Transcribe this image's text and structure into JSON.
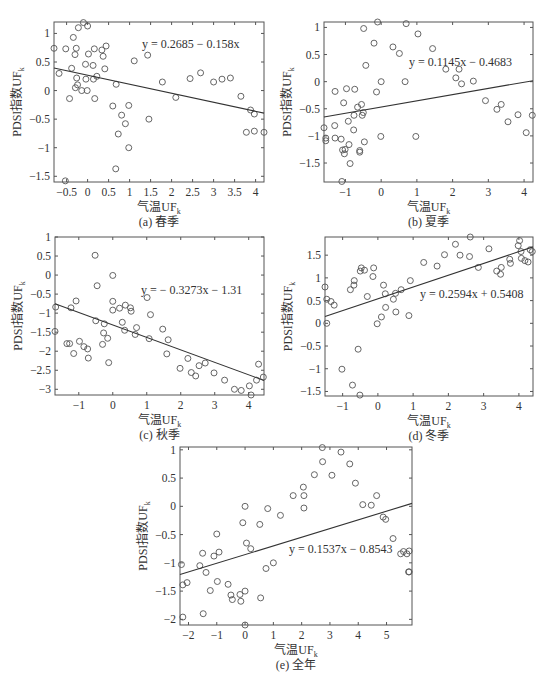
{
  "chart_data": [
    {
      "type": "scatter",
      "id": "a",
      "caption": "(a) 春季",
      "xlabel": "气温UF",
      "xlabel_sub": "k",
      "ylabel": "PDSI指数UF",
      "ylabel_sub": "k",
      "equation": "y = 0.2685 − 0.158x",
      "fit": {
        "slope": -0.158,
        "intercept": 0.2685
      },
      "xlim": [
        -0.8,
        4.2
      ],
      "ylim": [
        -1.6,
        1.2
      ],
      "xticks": [
        -0.5,
        0,
        0.5,
        1,
        1.5,
        2,
        2.5,
        3,
        3.5,
        4
      ],
      "yticks": [
        -1.5,
        -1,
        -0.5,
        0,
        0.5,
        1
      ],
      "box": {
        "left": 54,
        "top": 22,
        "right": 264,
        "bottom": 182
      },
      "eq_pos": {
        "x": 142,
        "y": 48
      },
      "points": [
        [
          -0.8,
          0.74
        ],
        [
          -0.68,
          0.3
        ],
        [
          -0.52,
          0.73
        ],
        [
          -0.43,
          -0.14
        ],
        [
          -0.38,
          0.39
        ],
        [
          -0.34,
          0.93
        ],
        [
          -0.3,
          0.63
        ],
        [
          -0.29,
          0.05
        ],
        [
          -0.27,
          0.74
        ],
        [
          -0.26,
          0.22
        ],
        [
          -0.24,
          0.1
        ],
        [
          -0.22,
          1.1
        ],
        [
          -0.14,
          0
        ],
        [
          -0.1,
          1.19
        ],
        [
          -0.05,
          0.46
        ],
        [
          -0.04,
          0.2
        ],
        [
          -0.01,
          0
        ],
        [
          0,
          1.13
        ],
        [
          0.02,
          0.64
        ],
        [
          0.13,
          0.44
        ],
        [
          0.14,
          0.2
        ],
        [
          0.16,
          0.73
        ],
        [
          0.17,
          -0.14
        ],
        [
          0.22,
          0.25
        ],
        [
          0.34,
          0.71
        ],
        [
          0.37,
          0.6
        ],
        [
          0.41,
          0.38
        ],
        [
          0.44,
          0.78
        ],
        [
          0.6,
          -0.27
        ],
        [
          0.67,
          -1.37
        ],
        [
          0.68,
          0.11
        ],
        [
          0.73,
          -0.76
        ],
        [
          0.81,
          -0.43
        ],
        [
          0.9,
          -0.58
        ],
        [
          0.98,
          -0.26
        ],
        [
          0.98,
          -1
        ],
        [
          1.11,
          0.52
        ],
        [
          1.43,
          0.62
        ],
        [
          1.46,
          -0.5
        ],
        [
          1.78,
          0.15
        ],
        [
          2.1,
          -0.12
        ],
        [
          2.44,
          0.21
        ],
        [
          2.69,
          0.31
        ],
        [
          3,
          0.15
        ],
        [
          3.2,
          0.2
        ],
        [
          3.4,
          0.22
        ],
        [
          3.65,
          -0.1
        ],
        [
          3.78,
          -0.73
        ],
        [
          3.88,
          -0.34
        ],
        [
          3.97,
          -0.41
        ],
        [
          3.97,
          -0.71
        ],
        [
          4.2,
          -0.73
        ],
        [
          -0.53,
          -1.58
        ]
      ]
    },
    {
      "type": "scatter",
      "id": "b",
      "caption": "(b) 夏季",
      "xlabel": "气温UF",
      "xlabel_sub": "k",
      "ylabel": "PDSI指数UF",
      "ylabel_sub": "k",
      "equation": "y = 0.1145x − 0.4683",
      "fit": {
        "slope": 0.1145,
        "intercept": -0.4683
      },
      "xlim": [
        -1.6,
        4.25
      ],
      "ylim": [
        -1.85,
        1.1
      ],
      "xticks": [
        -1,
        0,
        1,
        2,
        3,
        4
      ],
      "yticks": [
        -1.5,
        -1,
        -0.5,
        0,
        0.5,
        1
      ],
      "box": {
        "left": 324,
        "top": 22,
        "right": 533,
        "bottom": 182
      },
      "eq_pos": {
        "x": 409,
        "y": 66
      },
      "points": [
        [
          -1.6,
          -0.85
        ],
        [
          -1.55,
          -1.04
        ],
        [
          -1.55,
          -1.09
        ],
        [
          -1.3,
          -0.81
        ],
        [
          -1.29,
          -1.04
        ],
        [
          -1.29,
          -0.18
        ],
        [
          -1.12,
          -1.06
        ],
        [
          -1.08,
          -1.26
        ],
        [
          -1.05,
          -0.39
        ],
        [
          -1.03,
          -1.33
        ],
        [
          -1.01,
          -1.25
        ],
        [
          -0.97,
          -0.13
        ],
        [
          -0.92,
          -0.73
        ],
        [
          -0.9,
          -1.16
        ],
        [
          -0.87,
          -1.51
        ],
        [
          -0.77,
          -0.89
        ],
        [
          -0.76,
          -0.62
        ],
        [
          -0.74,
          -0.14
        ],
        [
          -0.66,
          -0.47
        ],
        [
          -0.6,
          -1.27
        ],
        [
          -0.6,
          -1.3
        ],
        [
          -0.55,
          -0.42
        ],
        [
          -0.53,
          -0.62
        ],
        [
          -0.5,
          -0.57
        ],
        [
          -0.49,
          0.98
        ],
        [
          -0.47,
          -1.11
        ],
        [
          -0.43,
          0.3
        ],
        [
          -0.2,
          0.71
        ],
        [
          -0.13,
          -0.19
        ],
        [
          -0.1,
          1.1
        ],
        [
          0,
          0
        ],
        [
          -0.01,
          -1.01
        ],
        [
          0.33,
          0.64
        ],
        [
          0.51,
          0.52
        ],
        [
          0.67,
          0
        ],
        [
          0.7,
          1.07
        ],
        [
          0.97,
          -1.01
        ],
        [
          1.03,
          0.88
        ],
        [
          1.44,
          0.61
        ],
        [
          1.81,
          0.23
        ],
        [
          2.09,
          0.07
        ],
        [
          2.18,
          0.23
        ],
        [
          2.25,
          -0.04
        ],
        [
          2.58,
          0.01
        ],
        [
          2.92,
          -0.35
        ],
        [
          3.24,
          -0.51
        ],
        [
          3.36,
          -0.42
        ],
        [
          3.55,
          -0.74
        ],
        [
          3.83,
          -0.61
        ],
        [
          4.06,
          -0.94
        ],
        [
          4.23,
          -0.62
        ],
        [
          -1.1,
          -1.84
        ]
      ]
    },
    {
      "type": "scatter",
      "id": "c",
      "caption": "(c) 秋季",
      "xlabel": "气温UF",
      "xlabel_sub": "k",
      "ylabel": "PDSI指数UF",
      "ylabel_sub": "k",
      "equation": "y = − 0.3273x − 1.31",
      "fit": {
        "slope": -0.3273,
        "intercept": -1.31
      },
      "xlim": [
        -1.7,
        4.45
      ],
      "ylim": [
        -3.15,
        1.0
      ],
      "xticks": [
        -1,
        0,
        1,
        2,
        3,
        4
      ],
      "yticks": [
        -3,
        -2.5,
        -2,
        -1.5,
        -1,
        -0.5,
        0,
        0.5,
        1
      ],
      "box": {
        "left": 55,
        "top": 237,
        "right": 264,
        "bottom": 395
      },
      "eq_pos": {
        "x": 141,
        "y": 294
      },
      "points": [
        [
          -1.68,
          -0.84
        ],
        [
          -1.7,
          -1.48
        ],
        [
          -1.35,
          -1.8
        ],
        [
          -1.27,
          -1.8
        ],
        [
          -1.23,
          -0.86
        ],
        [
          -1.15,
          -2.06
        ],
        [
          -1.08,
          -0.68
        ],
        [
          -0.98,
          -1.74
        ],
        [
          -0.85,
          -1.88
        ],
        [
          -0.74,
          -1.94
        ],
        [
          -0.72,
          -2.18
        ],
        [
          -0.52,
          0.52
        ],
        [
          -0.5,
          -1.2
        ],
        [
          -0.46,
          -0.28
        ],
        [
          -0.3,
          -1.82
        ],
        [
          -0.27,
          -1.52
        ],
        [
          -0.25,
          -1.28
        ],
        [
          -0.15,
          -1.66
        ],
        [
          -0.12,
          -2.3
        ],
        [
          0,
          -0.01
        ],
        [
          0.0,
          -0.69
        ],
        [
          0,
          -0.92
        ],
        [
          0.2,
          -0.87
        ],
        [
          0.28,
          -1.24
        ],
        [
          0.35,
          -1.45
        ],
        [
          0.37,
          -0.79
        ],
        [
          0.52,
          -0.86
        ],
        [
          0.54,
          -0.95
        ],
        [
          0.66,
          -1.56
        ],
        [
          0.7,
          -1.38
        ],
        [
          1.01,
          -0.59
        ],
        [
          1.07,
          -1.67
        ],
        [
          1.11,
          -1.04
        ],
        [
          1.47,
          -1.42
        ],
        [
          1.59,
          -2.07
        ],
        [
          1.63,
          -1.7
        ],
        [
          1.98,
          -2.45
        ],
        [
          2.21,
          -2.19
        ],
        [
          2.31,
          -2.56
        ],
        [
          2.44,
          -2.65
        ],
        [
          2.54,
          -2.38
        ],
        [
          2.72,
          -2.31
        ],
        [
          2.98,
          -2.57
        ],
        [
          3.29,
          -2.76
        ],
        [
          3.58,
          -3.0
        ],
        [
          3.78,
          -3.03
        ],
        [
          4.02,
          -2.91
        ],
        [
          4.07,
          -3.15
        ],
        [
          4.23,
          -2.76
        ],
        [
          4.29,
          -2.34
        ],
        [
          4.43,
          -2.68
        ]
      ]
    },
    {
      "type": "scatter",
      "id": "d",
      "caption": "(d) 冬季",
      "xlabel": "气温UF",
      "xlabel_sub": "k",
      "ylabel": "PDSI指数UF",
      "ylabel_sub": "k",
      "equation": "y = 0.2594x + 0.5408",
      "fit": {
        "slope": 0.2594,
        "intercept": 0.5408
      },
      "xlim": [
        -1.5,
        4.4
      ],
      "ylim": [
        -1.6,
        1.9
      ],
      "xticks": [
        -1,
        0,
        1,
        2,
        3,
        4
      ],
      "yticks": [
        -1.5,
        -1,
        -0.5,
        0,
        0.5,
        1,
        1.5
      ],
      "box": {
        "left": 325,
        "top": 237,
        "right": 533,
        "bottom": 396
      },
      "eq_pos": {
        "x": 420,
        "y": 298
      },
      "points": [
        [
          -1.5,
          0.8
        ],
        [
          -1.45,
          0.53
        ],
        [
          -1.45,
          0
        ],
        [
          -1.33,
          0.48
        ],
        [
          -1.24,
          0.4
        ],
        [
          -1.02,
          -1.01
        ],
        [
          -0.78,
          0.74
        ],
        [
          -0.72,
          -1.36
        ],
        [
          -0.68,
          0.84
        ],
        [
          -0.67,
          0.94
        ],
        [
          -0.56,
          -0.57
        ],
        [
          -0.51,
          -1.58
        ],
        [
          -0.5,
          1.15
        ],
        [
          -0.47,
          1.22
        ],
        [
          -0.38,
          1.17
        ],
        [
          -0.3,
          0.59
        ],
        [
          -0.14,
          1.03
        ],
        [
          -0.12,
          1.22
        ],
        [
          -0.02,
          -0.01
        ],
        [
          0.1,
          0.14
        ],
        [
          0.16,
          0.84
        ],
        [
          0.21,
          0.65
        ],
        [
          0.22,
          0.35
        ],
        [
          0.44,
          0.53
        ],
        [
          0.5,
          0.66
        ],
        [
          0.51,
          0.25
        ],
        [
          0.66,
          0.74
        ],
        [
          0.88,
          0.17
        ],
        [
          0.92,
          0.94
        ],
        [
          1.3,
          1.34
        ],
        [
          1.68,
          1.26
        ],
        [
          1.89,
          1.51
        ],
        [
          2.2,
          1.74
        ],
        [
          2.33,
          1.5
        ],
        [
          2.6,
          1.47
        ],
        [
          2.62,
          1.9
        ],
        [
          2.85,
          1.23
        ],
        [
          3.15,
          1.64
        ],
        [
          3.37,
          1.15
        ],
        [
          3.48,
          1.08
        ],
        [
          3.5,
          1.23
        ],
        [
          3.74,
          1.41
        ],
        [
          3.76,
          1.32
        ],
        [
          3.98,
          1.71
        ],
        [
          4.02,
          1.82
        ],
        [
          4.06,
          1.58
        ],
        [
          4.07,
          1.43
        ],
        [
          4.17,
          1.38
        ],
        [
          4.26,
          1.35
        ],
        [
          4.32,
          1.62
        ],
        [
          4.38,
          1.58
        ]
      ]
    },
    {
      "type": "scatter",
      "id": "e",
      "caption": "(e) 全年",
      "xlabel": "气温UF",
      "xlabel_sub": "k",
      "ylabel": "PDSI指数UF",
      "ylabel_sub": "k",
      "equation": "y = 0.1537x − 0.8543",
      "fit": {
        "slope": 0.1537,
        "intercept": -0.8543
      },
      "xlim": [
        -2.3,
        5.9
      ],
      "ylim": [
        -2.1,
        1.05
      ],
      "xticks": [
        -2,
        -1,
        0,
        1,
        2,
        3,
        4,
        5
      ],
      "yticks": [
        -2,
        -1.5,
        -1,
        -0.5,
        0,
        0.5,
        1
      ],
      "box": {
        "left": 180,
        "top": 447,
        "right": 412,
        "bottom": 625
      },
      "eq_pos": {
        "x": 289,
        "y": 553
      },
      "points": [
        [
          -2.25,
          -1.03
        ],
        [
          -2.2,
          -1.39
        ],
        [
          -2.2,
          -1.96
        ],
        [
          -2.05,
          -1.35
        ],
        [
          -1.6,
          -1.05
        ],
        [
          -1.5,
          -0.83
        ],
        [
          -1.48,
          -1.9
        ],
        [
          -1.38,
          -1.17
        ],
        [
          -1.23,
          -1.49
        ],
        [
          -1.1,
          -0.88
        ],
        [
          -1,
          -0.49
        ],
        [
          -0.98,
          -1.33
        ],
        [
          -0.92,
          -0.81
        ],
        [
          -0.6,
          -1.38
        ],
        [
          -0.5,
          -1.57
        ],
        [
          -0.45,
          -1.65
        ],
        [
          -0.18,
          -1.56
        ],
        [
          -0.15,
          -1.68
        ],
        [
          -0.08,
          -0.29
        ],
        [
          0,
          0
        ],
        [
          0,
          -1.5
        ],
        [
          0.05,
          -0.65
        ],
        [
          0.2,
          -0.75
        ],
        [
          0,
          -2.1
        ],
        [
          0.52,
          -0.32
        ],
        [
          0.55,
          -1.62
        ],
        [
          0.74,
          -1.1
        ],
        [
          0.8,
          -0.04
        ],
        [
          1.0,
          -1.0
        ],
        [
          1.25,
          -0.16
        ],
        [
          1.7,
          0.19
        ],
        [
          2.06,
          0.34
        ],
        [
          2.08,
          0.19
        ],
        [
          2.08,
          -0.03
        ],
        [
          2.45,
          0.56
        ],
        [
          2.73,
          1.04
        ],
        [
          2.74,
          0.79
        ],
        [
          3.07,
          0.55
        ],
        [
          3.39,
          0.96
        ],
        [
          3.7,
          0.75
        ],
        [
          3.9,
          0.41
        ],
        [
          4.16,
          0.03
        ],
        [
          4.46,
          0.02
        ],
        [
          4.65,
          0.19
        ],
        [
          4.88,
          -0.19
        ],
        [
          4.97,
          -0.23
        ],
        [
          5.23,
          -0.57
        ],
        [
          5.5,
          -0.84
        ],
        [
          5.6,
          -0.8
        ],
        [
          5.72,
          -0.84
        ],
        [
          5.8,
          -0.79
        ],
        [
          5.78,
          -1.16
        ],
        [
          5.8,
          -1.16
        ]
      ]
    }
  ]
}
